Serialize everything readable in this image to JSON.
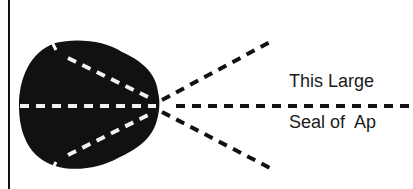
{
  "diagram": {
    "labels": {
      "line1": "This Large",
      "line2": "Seal of  Ap"
    },
    "colors": {
      "background": "#ffffff",
      "ink": "#111111",
      "dash_on_seal": "#ffffff"
    }
  }
}
